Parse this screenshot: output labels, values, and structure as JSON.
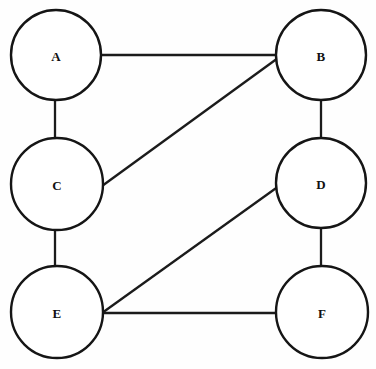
{
  "diagram": {
    "type": "node-link-graph",
    "background_color": "#fefefe",
    "stroke_color": "#1b1b1b",
    "node_fill_color": "#ffffff",
    "node_stroke_color": "#151515",
    "label_color": "#111111",
    "canvas": {
      "width": 376,
      "height": 369
    },
    "nodes": [
      {
        "id": "A",
        "label": "A",
        "cx": 56,
        "cy": 55,
        "r": 45
      },
      {
        "id": "B",
        "label": "B",
        "cx": 321,
        "cy": 55,
        "r": 45
      },
      {
        "id": "C",
        "label": "C",
        "cx": 57,
        "cy": 184,
        "r": 46
      },
      {
        "id": "D",
        "label": "D",
        "cx": 321,
        "cy": 183,
        "r": 45
      },
      {
        "id": "E",
        "label": "E",
        "cx": 57,
        "cy": 312,
        "r": 46
      },
      {
        "id": "F",
        "label": "F",
        "cx": 322,
        "cy": 312,
        "r": 46
      }
    ],
    "edges": [
      {
        "id": "edge-a-b",
        "from": "A",
        "to": "B",
        "kind": "horizontal",
        "x1": 101,
        "y1": 55,
        "x2": 276,
        "y2": 55
      },
      {
        "id": "edge-a-c",
        "from": "A",
        "to": "C",
        "kind": "vertical",
        "x1": 55,
        "y1": 100,
        "x2": 55,
        "y2": 138
      },
      {
        "id": "edge-c-b",
        "from": "C",
        "to": "B",
        "kind": "diagonal",
        "x1": 102,
        "y1": 186,
        "x2": 278,
        "y2": 58
      },
      {
        "id": "edge-c-e",
        "from": "C",
        "to": "E",
        "kind": "vertical",
        "x1": 55,
        "y1": 230,
        "x2": 55,
        "y2": 267
      },
      {
        "id": "edge-b-d",
        "from": "B",
        "to": "D",
        "kind": "vertical",
        "x1": 321,
        "y1": 100,
        "x2": 321,
        "y2": 138
      },
      {
        "id": "edge-e-d",
        "from": "E",
        "to": "D",
        "kind": "diagonal",
        "x1": 102,
        "y1": 313,
        "x2": 279,
        "y2": 186
      },
      {
        "id": "edge-d-f",
        "from": "D",
        "to": "F",
        "kind": "vertical",
        "x1": 321,
        "y1": 228,
        "x2": 321,
        "y2": 266
      },
      {
        "id": "edge-e-f",
        "from": "E",
        "to": "F",
        "kind": "horizontal",
        "x1": 102,
        "y1": 313,
        "x2": 277,
        "y2": 313
      }
    ],
    "adjacency": {
      "A": [
        "B",
        "C"
      ],
      "B": [
        "A",
        "C",
        "D"
      ],
      "C": [
        "A",
        "B",
        "E"
      ],
      "D": [
        "B",
        "E",
        "F"
      ],
      "E": [
        "C",
        "D",
        "F"
      ],
      "F": [
        "D",
        "E"
      ]
    },
    "counts": {
      "nodes": 6,
      "edges": 8
    }
  }
}
